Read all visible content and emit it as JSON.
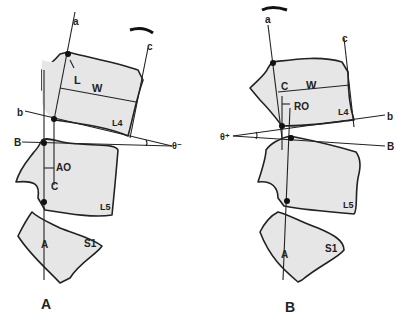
{
  "figure": {
    "panels": [
      {
        "id": "A",
        "caption": "A",
        "labels": {
          "a": "a",
          "b": "b",
          "c": "c",
          "B": "B",
          "A": "A",
          "L": "L",
          "W": "W",
          "AO": "AO",
          "C": "C",
          "L4": "L4",
          "L5": "L5",
          "S1": "S1",
          "theta": "θ⁻"
        },
        "rotation_arrow": "counter-clockwise-tilt-forward"
      },
      {
        "id": "B",
        "caption": "B",
        "labels": {
          "a": "a",
          "b": "b",
          "c": "c",
          "B": "B",
          "A": "A",
          "W": "W",
          "RO": "RO",
          "C": "C",
          "L4": "L4",
          "L5": "L5",
          "S1": "S1",
          "theta": "θ⁺"
        },
        "rotation_arrow": "clockwise-tilt-backward"
      }
    ],
    "colors": {
      "bone_fill": "#e6e6e6",
      "ink": "#222222",
      "background": "#ffffff"
    }
  }
}
